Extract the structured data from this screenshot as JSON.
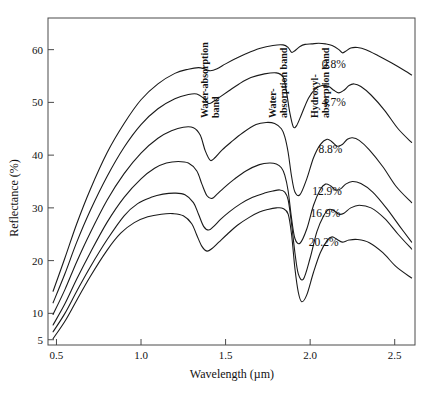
{
  "chart_data": {
    "type": "line",
    "title": "",
    "xlabel": "Wavelength (µm)",
    "ylabel": "Reflectance (%)",
    "xlim": [
      0.45,
      2.62
    ],
    "ylim": [
      4,
      66
    ],
    "grid": false,
    "legend_position": "inline-right-of-curve",
    "xticks": [
      0.5,
      1.0,
      1.5,
      2.0,
      2.5
    ],
    "xtick_labels": [
      "0.5",
      "1.0",
      "1.5",
      "2.0",
      "2.5"
    ],
    "yticks": [
      5,
      10,
      20,
      30,
      40,
      50,
      60
    ],
    "ytick_labels": [
      "5",
      "10",
      "20",
      "30",
      "40",
      "50",
      "60"
    ],
    "annotations": [
      {
        "name": "water-absorption-band-1400",
        "lines": [
          "Water-absorption",
          "band"
        ],
        "x": 1.4,
        "rotation": -90
      },
      {
        "name": "water-absorption-band-1900",
        "lines": [
          "Water-",
          "absorption band"
        ],
        "x": 1.9,
        "rotation": -90
      },
      {
        "name": "hydroxyl-absorption-band-2200",
        "lines": [
          "Hydroxyl-",
          "absorption band"
        ],
        "x": 2.2,
        "rotation": -90
      }
    ],
    "series": [
      {
        "name": "0.8%",
        "label": "0.8%",
        "label_x": 2.14,
        "label_y": 57.3,
        "x": [
          0.48,
          0.55,
          0.62,
          0.7,
          0.8,
          0.9,
          1.0,
          1.1,
          1.2,
          1.28,
          1.34,
          1.38,
          1.41,
          1.45,
          1.5,
          1.56,
          1.62,
          1.7,
          1.78,
          1.84,
          1.87,
          1.89,
          1.91,
          1.94,
          1.97,
          2.01,
          2.05,
          2.09,
          2.13,
          2.17,
          2.19,
          2.21,
          2.24,
          2.28,
          2.33,
          2.4,
          2.48,
          2.56,
          2.6
        ],
        "y": [
          14.2,
          20.5,
          27.0,
          33.5,
          40.5,
          46.0,
          50.5,
          53.5,
          55.5,
          56.3,
          56.6,
          56.3,
          56.0,
          56.4,
          57.3,
          58.3,
          59.2,
          60.2,
          60.8,
          60.9,
          60.4,
          59.5,
          59.8,
          60.6,
          61.0,
          61.1,
          61.2,
          61.1,
          60.8,
          60.0,
          59.4,
          59.7,
          60.3,
          60.4,
          60.0,
          58.9,
          57.5,
          56.0,
          55.2
        ]
      },
      {
        "name": "4.7%",
        "label": "4.7%",
        "label_x": 2.14,
        "label_y": 50.0,
        "x": [
          0.48,
          0.55,
          0.62,
          0.7,
          0.8,
          0.9,
          1.0,
          1.1,
          1.2,
          1.28,
          1.33,
          1.37,
          1.4,
          1.43,
          1.47,
          1.52,
          1.58,
          1.65,
          1.73,
          1.8,
          1.84,
          1.86,
          1.88,
          1.9,
          1.92,
          1.95,
          1.99,
          2.03,
          2.07,
          2.11,
          2.14,
          2.17,
          2.2,
          2.23,
          2.26,
          2.3,
          2.36,
          2.44,
          2.52,
          2.6
        ],
        "y": [
          12.0,
          17.5,
          23.5,
          29.5,
          36.0,
          41.5,
          45.8,
          48.8,
          50.7,
          51.5,
          51.6,
          50.8,
          49.8,
          50.2,
          51.1,
          52.2,
          53.5,
          54.7,
          55.4,
          55.6,
          54.8,
          52.0,
          48.0,
          45.4,
          45.6,
          47.8,
          50.8,
          52.5,
          53.2,
          53.0,
          52.3,
          51.8,
          52.3,
          53.2,
          53.5,
          53.0,
          51.4,
          48.5,
          45.0,
          42.4
        ]
      },
      {
        "name": "8.8%",
        "label": "8.8%",
        "label_x": 2.12,
        "label_y": 41.2,
        "x": [
          0.48,
          0.55,
          0.62,
          0.7,
          0.8,
          0.9,
          1.0,
          1.1,
          1.18,
          1.25,
          1.31,
          1.35,
          1.38,
          1.41,
          1.44,
          1.48,
          1.53,
          1.6,
          1.68,
          1.74,
          1.79,
          1.83,
          1.85,
          1.87,
          1.89,
          1.91,
          1.94,
          1.98,
          2.02,
          2.06,
          2.1,
          2.13,
          2.16,
          2.19,
          2.22,
          2.25,
          2.29,
          2.35,
          2.43,
          2.51,
          2.6
        ],
        "y": [
          9.8,
          14.5,
          19.8,
          25.3,
          31.5,
          36.5,
          40.4,
          43.2,
          44.6,
          45.3,
          45.2,
          43.8,
          40.8,
          39.0,
          39.6,
          41.0,
          42.4,
          44.2,
          45.8,
          46.2,
          46.0,
          45.0,
          43.5,
          40.5,
          36.0,
          33.0,
          32.5,
          35.5,
          39.5,
          42.0,
          43.0,
          42.5,
          41.7,
          42.0,
          43.0,
          43.3,
          42.8,
          41.0,
          37.8,
          34.0,
          31.0
        ]
      },
      {
        "name": "12.9%",
        "label": "12.9%",
        "label_x": 2.1,
        "label_y": 33.2,
        "x": [
          0.48,
          0.55,
          0.62,
          0.7,
          0.8,
          0.9,
          1.0,
          1.08,
          1.15,
          1.22,
          1.28,
          1.33,
          1.36,
          1.39,
          1.42,
          1.45,
          1.49,
          1.55,
          1.62,
          1.7,
          1.76,
          1.8,
          1.83,
          1.85,
          1.87,
          1.89,
          1.91,
          1.94,
          1.98,
          2.02,
          2.06,
          2.09,
          2.12,
          2.15,
          2.18,
          2.21,
          2.25,
          2.3,
          2.37,
          2.45,
          2.53,
          2.6
        ],
        "y": [
          7.8,
          11.8,
          16.5,
          21.5,
          27.3,
          32.0,
          35.5,
          37.5,
          38.5,
          38.8,
          38.5,
          37.0,
          34.5,
          32.3,
          31.8,
          32.6,
          33.8,
          35.4,
          37.0,
          38.2,
          38.5,
          38.3,
          37.6,
          36.2,
          33.2,
          28.0,
          24.2,
          23.3,
          26.0,
          30.5,
          33.5,
          34.5,
          34.2,
          33.4,
          33.6,
          34.5,
          35.0,
          34.6,
          33.0,
          30.0,
          26.5,
          23.5
        ]
      },
      {
        "name": "16.9%",
        "label": "16.9%",
        "label_x": 2.09,
        "label_y": 29.0,
        "x": [
          0.48,
          0.55,
          0.62,
          0.7,
          0.8,
          0.9,
          0.98,
          1.06,
          1.13,
          1.2,
          1.26,
          1.31,
          1.34,
          1.37,
          1.4,
          1.43,
          1.47,
          1.52,
          1.59,
          1.66,
          1.73,
          1.78,
          1.82,
          1.85,
          1.87,
          1.89,
          1.91,
          1.93,
          1.96,
          2.0,
          2.04,
          2.08,
          2.11,
          2.14,
          2.17,
          2.2,
          2.24,
          2.29,
          2.36,
          2.44,
          2.52,
          2.6
        ],
        "y": [
          6.5,
          10.0,
          14.2,
          18.8,
          24.0,
          28.5,
          30.8,
          32.0,
          32.6,
          32.8,
          32.5,
          31.0,
          28.8,
          26.5,
          25.8,
          26.5,
          27.8,
          29.2,
          30.8,
          32.0,
          32.8,
          33.2,
          33.4,
          33.0,
          31.5,
          27.0,
          21.5,
          17.5,
          16.5,
          20.5,
          25.5,
          28.5,
          29.7,
          29.5,
          28.8,
          29.0,
          30.0,
          30.5,
          30.0,
          28.0,
          25.0,
          22.2
        ]
      },
      {
        "name": "20.2%",
        "label": "20.2%",
        "label_x": 2.08,
        "label_y": 23.6,
        "x": [
          0.48,
          0.55,
          0.62,
          0.7,
          0.8,
          0.88,
          0.96,
          1.04,
          1.12,
          1.19,
          1.25,
          1.3,
          1.33,
          1.36,
          1.39,
          1.42,
          1.46,
          1.51,
          1.57,
          1.64,
          1.7,
          1.75,
          1.8,
          1.84,
          1.87,
          1.89,
          1.91,
          1.93,
          1.95,
          1.98,
          2.02,
          2.06,
          2.1,
          2.13,
          2.16,
          2.19,
          2.23,
          2.28,
          2.35,
          2.43,
          2.51,
          2.6
        ],
        "y": [
          5.2,
          8.5,
          12.5,
          17.0,
          22.0,
          25.2,
          27.2,
          28.3,
          28.8,
          28.9,
          28.5,
          27.0,
          24.8,
          22.7,
          21.8,
          22.3,
          23.5,
          25.0,
          26.7,
          28.2,
          29.2,
          29.7,
          30.0,
          29.9,
          28.8,
          25.0,
          18.5,
          14.0,
          12.2,
          13.5,
          17.8,
          21.5,
          23.8,
          24.5,
          24.0,
          23.5,
          23.9,
          24.0,
          23.4,
          21.5,
          18.8,
          16.7
        ]
      }
    ]
  }
}
